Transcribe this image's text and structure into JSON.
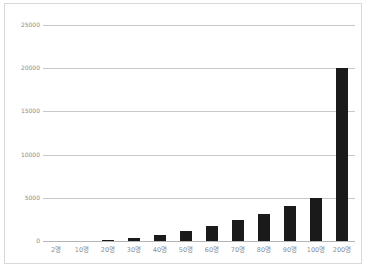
{
  "chart_data": {
    "type": "bar",
    "title": "",
    "xlabel": "",
    "ylabel": "",
    "categories": [
      "2명",
      "10명",
      "20명",
      "30명",
      "40명",
      "50명",
      "60명",
      "70명",
      "80명",
      "90명",
      "100명",
      "200명"
    ],
    "values": [
      0,
      0,
      150,
      400,
      750,
      1200,
      1700,
      2400,
      3100,
      4000,
      5000,
      20000
    ],
    "ylim": [
      0,
      25000
    ],
    "ytick_labels": [
      "0",
      "5000",
      "10000",
      "15000",
      "20000",
      "25000"
    ],
    "ytick_values": [
      0,
      5000,
      10000,
      15000,
      20000,
      25000
    ],
    "grid": true,
    "legend": "none",
    "series_color": "#1a1a1a",
    "gridline_color": "#c8c8c8",
    "axis_label_color": "#8c8c8c",
    "frame_border_color": "#d9d9d9",
    "background_color": "#ffffff"
  },
  "caption": {
    "text": ""
  }
}
